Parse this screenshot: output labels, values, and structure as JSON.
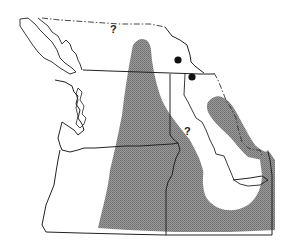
{
  "map": {
    "type": "species distribution range map",
    "region": "Pacific Northwest (southern British Columbia, Washington, Oregon, Idaho, western Montana)",
    "colors": {
      "range_fill": "#8a8a8a",
      "border": "#222222",
      "background": "#ffffff",
      "dot": "#111111"
    },
    "legend": {
      "shaded": "distribution range",
      "dots": "isolated records",
      "question_marks": "uncertain occurrence",
      "dash_dot_line": "northern/eastern limit of mapped area"
    },
    "labels": {
      "q_north": "?",
      "q_idaho": "?"
    },
    "dots": [
      {
        "id": "dot-1",
        "x": 178,
        "y": 60
      },
      {
        "id": "dot-2",
        "x": 192,
        "y": 77
      }
    ]
  }
}
